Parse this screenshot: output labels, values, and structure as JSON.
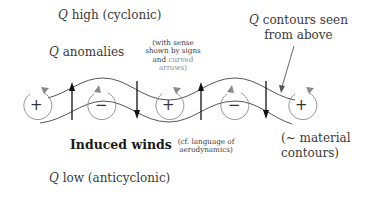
{
  "labels": {
    "q_high": {
      "q": "Q",
      "text": " high (cyclonic)"
    },
    "q_anomalies": {
      "q": "Q",
      "text": " anomalies"
    },
    "sense_note": {
      "line1": "(with sense",
      "line2": "shown by signs",
      "line3_a": "and ",
      "line3_b": "curved",
      "line4": "arrows)"
    },
    "q_contours": {
      "q": "Q",
      "line1": " contours seen",
      "line2": "from above"
    },
    "induced_winds": "Induced winds",
    "aero_note": {
      "line1": "(cf. language of",
      "line2": "aerodynamics)"
    },
    "material_contours": {
      "line1": "(~ material",
      "line2": "contours)"
    },
    "q_low": {
      "q": "Q",
      "text": " low (anticyclonic)"
    }
  },
  "anomalies": [
    {
      "sign": "+",
      "cx": 37
    },
    {
      "sign": "−",
      "cx": 101
    },
    {
      "sign": "+",
      "cx": 169
    },
    {
      "sign": "−",
      "cx": 234
    },
    {
      "sign": "+",
      "cx": 302
    }
  ],
  "induced_wind_arrows": [
    {
      "x": 72,
      "direction": "up"
    },
    {
      "x": 137,
      "direction": "down"
    },
    {
      "x": 201,
      "direction": "up"
    },
    {
      "x": 266,
      "direction": "down"
    }
  ],
  "colors": {
    "contour": "#555555",
    "circulation": "#8a8a8a",
    "wind_arrow": "#111111",
    "text": "#3a3a3a"
  }
}
